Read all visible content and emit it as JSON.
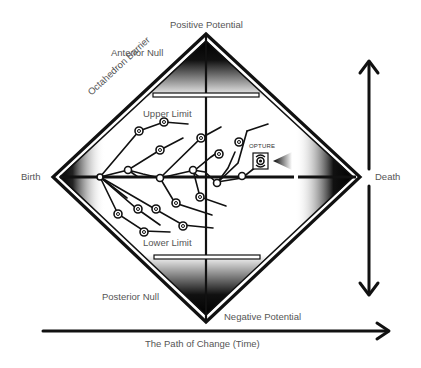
{
  "diagram": {
    "labels": {
      "positive_potential": "Positive Potential",
      "anterior_null": "Anterior Null",
      "octahedron_barrier": "Octahedron Barrier",
      "upper_limit": "Upper Limit",
      "birth": "Birth",
      "death": "Death",
      "opture": "OPTURE",
      "lower_limit": "Lower Limit",
      "posterior_null": "Posterior Null",
      "negative_potential": "Negative Potential",
      "time_axis": "The Path of Change (Time)"
    },
    "colors": {
      "ink": "#111111",
      "label_text": "#555555",
      "background": "#ffffff"
    },
    "nodes": {
      "birth_vertex": [
        53,
        177
      ],
      "death_vertex": [
        360,
        177
      ],
      "positive_vertex": [
        206,
        34
      ],
      "negative_vertex": [
        206,
        322
      ]
    }
  }
}
